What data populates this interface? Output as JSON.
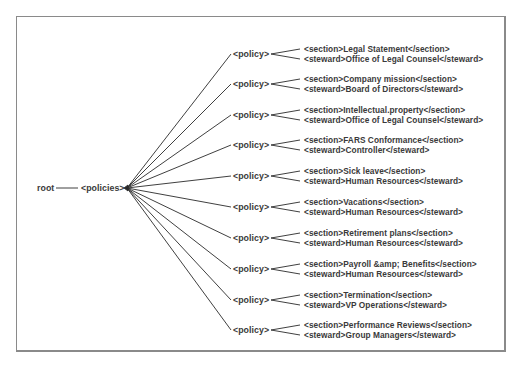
{
  "diagram": {
    "root_label": "root",
    "policies_label": "<policies>",
    "policy_label": "<policy>",
    "colors": {
      "line": "#2a2a2a",
      "text": "#3a3a3a",
      "frame": "#8a8a8a"
    },
    "policies": [
      {
        "section": "<section>Legal Statement</section>",
        "steward": "<steward>Office of Legal Counsel</steward>"
      },
      {
        "section": "<section>Company mission</section>",
        "steward": "<steward>Board of Directors</steward>"
      },
      {
        "section": "<section>Intellectual.property</section>",
        "steward": "<steward>Office of Legal Counsel</steward>"
      },
      {
        "section": "<section>FARS Conformance</section>",
        "steward": "<steward>Controller</steward>"
      },
      {
        "section": "<section>Sick leave</section>",
        "steward": "<steward>Human Resources</steward>"
      },
      {
        "section": "<section>Vacations</section>",
        "steward": "<steward>Human Resources</steward>"
      },
      {
        "section": "<section>Retirement plans</section>",
        "steward": "<steward>Human Resources</steward>"
      },
      {
        "section": "<section>Payroll &amp; Benefits</section>",
        "steward": "<steward>Human Resources</steward>"
      },
      {
        "section": "<section>Termination</section>",
        "steward": "<steward>VP Operations</steward>"
      },
      {
        "section": "<section>Performance Reviews</section>",
        "steward": "<steward>Group Managers</steward>"
      }
    ]
  }
}
